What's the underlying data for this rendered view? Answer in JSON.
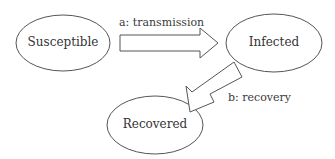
{
  "diagram": {
    "nodes": [
      {
        "id": "S",
        "label": "Susceptible"
      },
      {
        "id": "I",
        "label": "Infected"
      },
      {
        "id": "R",
        "label": "Recovered"
      }
    ],
    "edges": [
      {
        "from": "S",
        "to": "I",
        "label": "a: transmission"
      },
      {
        "from": "I",
        "to": "R",
        "label": "b: recovery"
      }
    ]
  }
}
